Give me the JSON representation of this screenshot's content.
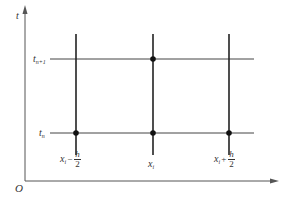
{
  "diagram": {
    "type": "finite-difference-grid",
    "axes": {
      "origin_label": "O",
      "y_axis_label": "t",
      "x_axis_label": ""
    },
    "time_levels": [
      {
        "id": "t_n",
        "base": "t",
        "subscript": "n"
      },
      {
        "id": "t_n_plus_1",
        "base": "t",
        "subscript": "n+1"
      }
    ],
    "space_points": [
      {
        "id": "x_i_minus_half",
        "base": "x",
        "subscript": "i",
        "operator": "−",
        "frac_num": "h",
        "frac_den": "2"
      },
      {
        "id": "x_i",
        "base": "x",
        "subscript": "i"
      },
      {
        "id": "x_i_plus_half",
        "base": "x",
        "subscript": "i",
        "operator": "+",
        "frac_num": "h",
        "frac_den": "2"
      }
    ],
    "nodes": [
      {
        "x": "x_i - h/2",
        "t": "t_n"
      },
      {
        "x": "x_i",
        "t": "t_n"
      },
      {
        "x": "x_i + h/2",
        "t": "t_n"
      },
      {
        "x": "x_i",
        "t": "t_n+1"
      }
    ],
    "colors": {
      "axis": "#555555",
      "grid_line": "#333333",
      "node": "#111111",
      "text": "#333333"
    }
  }
}
